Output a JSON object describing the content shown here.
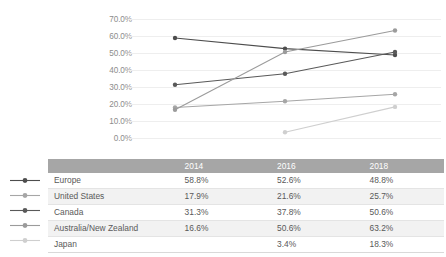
{
  "chart_data": {
    "type": "line",
    "title": "",
    "xlabel": "",
    "ylabel": "",
    "categories": [
      "2014",
      "2016",
      "2018"
    ],
    "ylim": [
      0,
      70
    ],
    "ytick_labels": [
      "70.0%",
      "60.0%",
      "50.0%",
      "40.0%",
      "30.0%",
      "20.0%",
      "10.0%",
      "0.0%"
    ],
    "ytick_values": [
      70,
      60,
      50,
      40,
      30,
      20,
      10,
      0
    ],
    "grid": true,
    "legend_position": "table-below",
    "series": [
      {
        "name": "Europe",
        "values": [
          58.8,
          52.6,
          48.8
        ],
        "color": "#4d4d4d"
      },
      {
        "name": "United States",
        "values": [
          17.9,
          21.6,
          25.7
        ],
        "color": "#a6a6a6"
      },
      {
        "name": "Canada",
        "values": [
          31.3,
          37.8,
          50.6
        ],
        "color": "#595959"
      },
      {
        "name": "Australia/New Zealand",
        "values": [
          16.6,
          50.6,
          63.2
        ],
        "color": "#9b9b9b"
      },
      {
        "name": "Japan",
        "values": [
          null,
          3.4,
          18.3
        ],
        "color": "#cfcfcf"
      }
    ]
  },
  "table": {
    "header": {
      "name_label": "",
      "columns": [
        "2014",
        "2016",
        "2018"
      ]
    },
    "rows": [
      {
        "name": "Europe",
        "2014": "58.8%",
        "2016": "52.6%",
        "2018": "48.8%"
      },
      {
        "name": "United States",
        "2014": "17.9%",
        "2016": "21.6%",
        "2018": "25.7%"
      },
      {
        "name": "Canada",
        "2014": "31.3%",
        "2016": "37.8%",
        "2018": "50.6%"
      },
      {
        "name": "Australia/New Zealand",
        "2014": "16.6%",
        "2016": "50.6%",
        "2018": "63.2%"
      },
      {
        "name": "Japan",
        "2014": "",
        "2016": "3.4%",
        "2018": "18.3%"
      }
    ]
  },
  "colors": {
    "header_bar": "#a6a6a6",
    "row_alt": "#f2f2f2",
    "grid": "#eeeeee",
    "text": "#595959",
    "tick_text": "#8c8c8c"
  }
}
